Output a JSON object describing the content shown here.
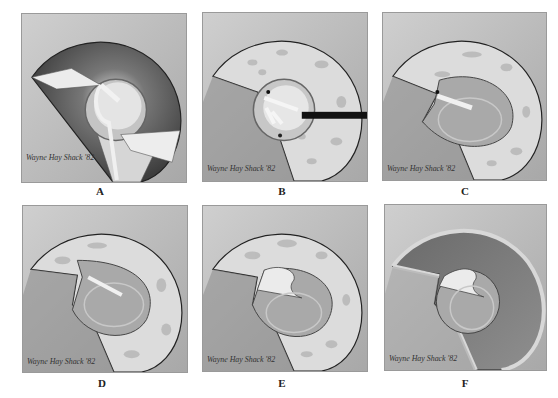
{
  "figure": {
    "type": "medical-illustration",
    "layout": "2x3 grid",
    "panels": [
      {
        "id": "A",
        "label": "A",
        "signature": "Wayne Hay Shack '82"
      },
      {
        "id": "B",
        "label": "B",
        "signature": "Wayne Hay Shack '82"
      },
      {
        "id": "C",
        "label": "C",
        "signature": "Wayne Hay Shack '82"
      },
      {
        "id": "D",
        "label": "D",
        "signature": "Wayne Hay Shack '82"
      },
      {
        "id": "E",
        "label": "E",
        "signature": "Wayne Hay Shack '82"
      },
      {
        "id": "F",
        "label": "F",
        "signature": "Wayne Hay Shack '82"
      }
    ]
  },
  "colors": {
    "background": "#bdbdbd",
    "shadow": "#5e5e5e",
    "rim": "#d8d8d8",
    "disc": "#a9a9a9",
    "outline": "#333333",
    "instrument": "#111111"
  }
}
